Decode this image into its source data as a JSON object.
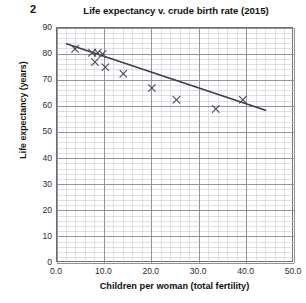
{
  "question_number": "2",
  "chart_data": {
    "type": "scatter",
    "title": "Life expectancy v. crude birth rate (2015)",
    "xlabel": "Children per woman (total fertility)",
    "ylabel": "Life expectancy (years)",
    "xlim": [
      0,
      50
    ],
    "ylim": [
      0,
      90
    ],
    "xticks": [
      "0.0",
      "10.0",
      "20.0",
      "30.0",
      "40.0",
      "50.0"
    ],
    "xtick_values": [
      0,
      10,
      20,
      30,
      40,
      50
    ],
    "yticks": [
      "0",
      "10",
      "20",
      "30",
      "40",
      "50",
      "60",
      "70",
      "80",
      "90"
    ],
    "ytick_values": [
      0,
      10,
      20,
      30,
      40,
      50,
      60,
      70,
      80,
      90
    ],
    "grid": true,
    "minor_grid": true,
    "minor_grid_divisions": 5,
    "legend": "none",
    "marker": "x",
    "marker_color": "#4a4a5a",
    "line_color": "#3c3c46",
    "points": [
      {
        "x": 3.8,
        "y": 82.0
      },
      {
        "x": 7.4,
        "y": 80.5
      },
      {
        "x": 8.6,
        "y": 80.5
      },
      {
        "x": 9.6,
        "y": 80.0
      },
      {
        "x": 8.0,
        "y": 77.0
      },
      {
        "x": 10.2,
        "y": 75.0
      },
      {
        "x": 14.0,
        "y": 72.5
      },
      {
        "x": 20.0,
        "y": 67.0
      },
      {
        "x": 25.2,
        "y": 62.5
      },
      {
        "x": 33.5,
        "y": 59.0
      },
      {
        "x": 39.2,
        "y": 62.5
      }
    ],
    "trend_line": {
      "label": "line of best fit",
      "x0": 2.0,
      "y0": 84.0,
      "x1": 44.0,
      "y1": 58.5
    }
  }
}
